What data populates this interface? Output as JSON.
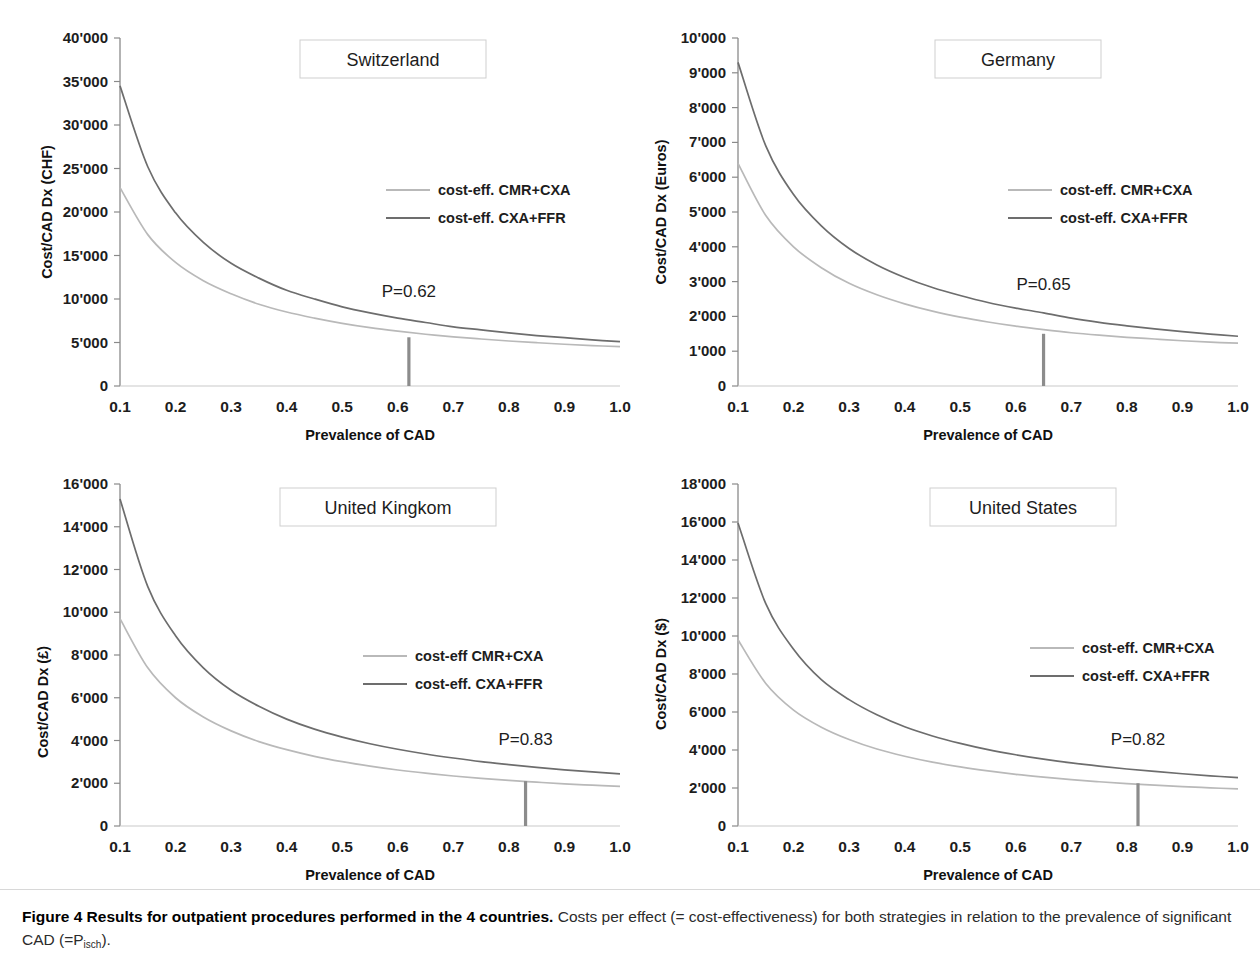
{
  "figure": {
    "caption_bold": "Figure 4 Results for outpatient procedures performed in the 4 countries.",
    "caption_rest": " Costs per effect (= cost-effectiveness) for both strategies in relation to the prevalence of significant CAD (=P",
    "caption_sub": "isch",
    "caption_end": ").",
    "series_colors": {
      "cmr_cxa": "#b9b9b9",
      "cxa_ffr": "#6d6d6d",
      "marker": "#8c8c8c",
      "axis": "#8a8a8a"
    }
  },
  "chart_data": [
    {
      "type": "line",
      "title": "Switzerland",
      "xlabel": "Prevalence of CAD",
      "ylabel": "Cost/CAD Dx (CHF)",
      "currency": "CHF",
      "xlim": [
        0.1,
        1.0
      ],
      "ylim": [
        0,
        40000
      ],
      "xticks": [
        "0.1",
        "0.2",
        "0.3",
        "0.4",
        "0.5",
        "0.6",
        "0.7",
        "0.8",
        "0.9",
        "1.0"
      ],
      "yticks": [
        "0",
        "5'000",
        "10'000",
        "15'000",
        "20'000",
        "25'000",
        "30'000",
        "35'000",
        "40'000"
      ],
      "ytick_values": [
        0,
        5000,
        10000,
        15000,
        20000,
        25000,
        30000,
        35000,
        40000
      ],
      "grid": false,
      "legend_position": "center-right",
      "annotation": "P=0.62",
      "annotation_x": 0.62,
      "annotation_y": 5600,
      "x": [
        0.1,
        0.15,
        0.2,
        0.25,
        0.3,
        0.35,
        0.4,
        0.45,
        0.5,
        0.55,
        0.6,
        0.65,
        0.7,
        0.75,
        0.8,
        0.85,
        0.9,
        0.95,
        1.0
      ],
      "series": [
        {
          "name": "cost-eff. CMR+CXA",
          "color": "#b9b9b9",
          "values": [
            22800,
            17400,
            14200,
            12100,
            10600,
            9400,
            8500,
            7800,
            7200,
            6700,
            6300,
            5950,
            5650,
            5400,
            5170,
            4980,
            4800,
            4650,
            4520
          ]
        },
        {
          "name": "cost-eff. CXA+FFR",
          "color": "#6d6d6d",
          "values": [
            34500,
            25200,
            19900,
            16500,
            14100,
            12400,
            11000,
            10000,
            9100,
            8400,
            7800,
            7300,
            6800,
            6450,
            6100,
            5800,
            5550,
            5300,
            5100
          ]
        }
      ]
    },
    {
      "type": "line",
      "title": "Germany",
      "xlabel": "Prevalence of CAD",
      "ylabel": "Cost/CAD Dx (Euros)",
      "currency": "Euros",
      "xlim": [
        0.1,
        1.0
      ],
      "ylim": [
        0,
        10000
      ],
      "xticks": [
        "0.1",
        "0.2",
        "0.3",
        "0.4",
        "0.5",
        "0.6",
        "0.7",
        "0.8",
        "0.9",
        "1.0"
      ],
      "yticks": [
        "0",
        "1'000",
        "2'000",
        "3'000",
        "4'000",
        "5'000",
        "6'000",
        "7'000",
        "8'000",
        "9'000",
        "10'000"
      ],
      "ytick_values": [
        0,
        1000,
        2000,
        3000,
        4000,
        5000,
        6000,
        7000,
        8000,
        9000,
        10000
      ],
      "grid": false,
      "legend_position": "center-right",
      "annotation": "P=0.65",
      "annotation_x": 0.65,
      "annotation_y": 1500,
      "x": [
        0.1,
        0.15,
        0.2,
        0.25,
        0.3,
        0.35,
        0.4,
        0.45,
        0.5,
        0.55,
        0.6,
        0.65,
        0.7,
        0.75,
        0.8,
        0.85,
        0.9,
        0.95,
        1.0
      ],
      "series": [
        {
          "name": "cost-eff. CMR+CXA",
          "color": "#b9b9b9",
          "values": [
            6400,
            4900,
            4000,
            3400,
            2950,
            2620,
            2360,
            2150,
            1980,
            1840,
            1720,
            1620,
            1530,
            1460,
            1400,
            1350,
            1300,
            1260,
            1230
          ]
        },
        {
          "name": "cost-eff. CXA+FFR",
          "color": "#6d6d6d",
          "values": [
            9300,
            6900,
            5500,
            4600,
            3950,
            3480,
            3120,
            2830,
            2600,
            2400,
            2240,
            2100,
            1950,
            1830,
            1730,
            1640,
            1560,
            1490,
            1430
          ]
        }
      ]
    },
    {
      "type": "line",
      "title": "United Kingkom",
      "xlabel": "Prevalence of CAD",
      "ylabel": "Cost/CAD Dx (£)",
      "currency": "£",
      "xlim": [
        0.1,
        1.0
      ],
      "ylim": [
        0,
        16000
      ],
      "xticks": [
        "0.1",
        "0.2",
        "0.3",
        "0.4",
        "0.5",
        "0.6",
        "0.7",
        "0.8",
        "0.9",
        "1.0"
      ],
      "yticks": [
        "0",
        "2'000",
        "4'000",
        "6'000",
        "8'000",
        "10'000",
        "12'000",
        "14'000",
        "16'000"
      ],
      "ytick_values": [
        0,
        2000,
        4000,
        6000,
        8000,
        10000,
        12000,
        14000,
        16000
      ],
      "grid": false,
      "legend_position": "center-right",
      "annotation": "P=0.83",
      "annotation_x": 0.83,
      "annotation_y": 2100,
      "x": [
        0.1,
        0.15,
        0.2,
        0.25,
        0.3,
        0.35,
        0.4,
        0.45,
        0.5,
        0.55,
        0.6,
        0.65,
        0.7,
        0.75,
        0.8,
        0.85,
        0.9,
        0.95,
        1.0
      ],
      "series": [
        {
          "name": "cost-eff CMR+CXA",
          "color": "#b9b9b9",
          "values": [
            9700,
            7400,
            6000,
            5100,
            4450,
            3950,
            3570,
            3260,
            3010,
            2800,
            2620,
            2470,
            2340,
            2230,
            2130,
            2050,
            1970,
            1910,
            1850
          ]
        },
        {
          "name": "cost-eff. CXA+FFR",
          "color": "#6d6d6d",
          "values": [
            15300,
            11200,
            8900,
            7400,
            6350,
            5600,
            5000,
            4530,
            4160,
            3850,
            3590,
            3370,
            3180,
            3010,
            2870,
            2740,
            2630,
            2530,
            2440
          ]
        }
      ]
    },
    {
      "type": "line",
      "title": "United States",
      "xlabel": "Prevalence of CAD",
      "ylabel": "Cost/CAD Dx ($)",
      "currency": "$",
      "xlim": [
        0.1,
        1.0
      ],
      "ylim": [
        0,
        18000
      ],
      "xticks": [
        "0.1",
        "0.2",
        "0.3",
        "0.4",
        "0.5",
        "0.6",
        "0.7",
        "0.8",
        "0.9",
        "1.0"
      ],
      "yticks": [
        "0",
        "2'000",
        "4'000",
        "6'000",
        "8'000",
        "10'000",
        "12'000",
        "14'000",
        "16'000",
        "18'000"
      ],
      "ytick_values": [
        0,
        2000,
        4000,
        6000,
        8000,
        10000,
        12000,
        14000,
        16000,
        18000
      ],
      "grid": false,
      "legend_position": "center-right",
      "annotation": "P=0.82",
      "annotation_x": 0.82,
      "annotation_y": 2250,
      "x": [
        0.1,
        0.15,
        0.2,
        0.25,
        0.3,
        0.35,
        0.4,
        0.45,
        0.5,
        0.55,
        0.6,
        0.65,
        0.7,
        0.75,
        0.8,
        0.85,
        0.9,
        0.95,
        1.0
      ],
      "series": [
        {
          "name": "cost-eff. CMR+CXA",
          "color": "#b9b9b9",
          "values": [
            9800,
            7500,
            6100,
            5200,
            4550,
            4050,
            3670,
            3360,
            3110,
            2900,
            2720,
            2570,
            2440,
            2330,
            2230,
            2150,
            2070,
            2010,
            1950
          ]
        },
        {
          "name": "cost-eff. CXA+FFR",
          "color": "#6d6d6d",
          "values": [
            15950,
            11700,
            9300,
            7700,
            6650,
            5850,
            5220,
            4740,
            4350,
            4020,
            3750,
            3520,
            3320,
            3150,
            3000,
            2870,
            2750,
            2640,
            2550
          ]
        }
      ]
    }
  ]
}
